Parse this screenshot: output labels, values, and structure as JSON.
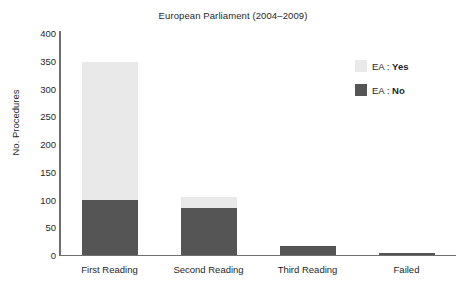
{
  "chart_data": {
    "type": "bar",
    "subtype": "stacked-vertical",
    "title": "European Parliament (2004–2009)",
    "xlabel": "",
    "ylabel": "No. Procedures",
    "categories": [
      "First Reading",
      "Second Reading",
      "Third Reading",
      "Failed"
    ],
    "series": [
      {
        "name": "EA : No",
        "values": [
          100,
          84,
          16,
          3
        ],
        "color": "#555555"
      },
      {
        "name": "EA : Yes",
        "values": [
          248,
          21,
          0,
          0
        ],
        "color": "#e9e9e9"
      }
    ],
    "stack_totals": [
      348,
      105,
      16,
      3
    ],
    "ylim": [
      0,
      400
    ],
    "yticks": [
      0,
      50,
      100,
      150,
      200,
      250,
      300,
      350,
      400
    ],
    "ytick_labels": [
      "0",
      "50",
      "100",
      "150",
      "200",
      "250",
      "300",
      "350",
      "400"
    ],
    "grid": false,
    "legend_position": "top-right",
    "legend": [
      {
        "prefix": "EA : ",
        "value": "Yes",
        "color": "#e9e9e9"
      },
      {
        "prefix": "EA : ",
        "value": "No",
        "color": "#555555"
      }
    ]
  },
  "axes": {
    "axis_color": "#6e6e6e"
  }
}
